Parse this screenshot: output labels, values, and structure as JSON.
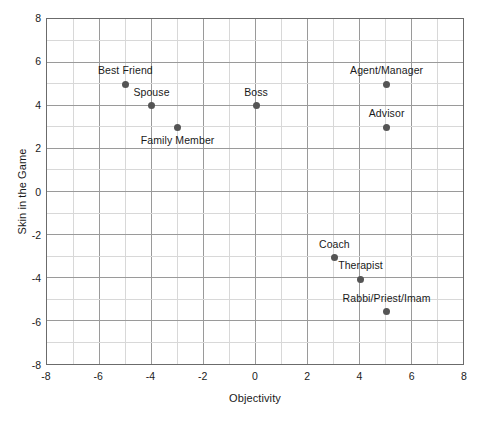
{
  "chart_data": {
    "type": "scatter",
    "title": "",
    "xlabel": "Objectivity",
    "ylabel": "Skin in the Game",
    "xlim": [
      -8,
      8
    ],
    "ylim": [
      -8,
      8
    ],
    "xticks": [
      "-8",
      "-6",
      "-4",
      "-2",
      "0",
      "2",
      "4",
      "6",
      "8"
    ],
    "xtick_values": [
      -8,
      -6,
      -4,
      -2,
      0,
      2,
      4,
      6,
      8
    ],
    "yticks": [
      "-8",
      "-6",
      "-4",
      "-2",
      "0",
      "2",
      "4",
      "6",
      "8"
    ],
    "ytick_values": [
      -8,
      -6,
      -4,
      -2,
      0,
      2,
      4,
      6,
      8
    ],
    "grid": true,
    "grid_minor_step": 1,
    "grid_major_step": 2,
    "legend": "none",
    "marker_color": "#555555",
    "grid_major_color": "#9a9a9a",
    "grid_minor_color": "#d8d8d8",
    "frame_color": "#6b6b6b",
    "points": [
      {
        "label": "Best Friend",
        "x": -5,
        "y": 5,
        "label_pos": "above"
      },
      {
        "label": "Spouse",
        "x": -4,
        "y": 4,
        "label_pos": "above"
      },
      {
        "label": "Family Member",
        "x": -3,
        "y": 3,
        "label_pos": "below"
      },
      {
        "label": "Boss",
        "x": 0,
        "y": 4,
        "label_pos": "above"
      },
      {
        "label": "Agent/Manager",
        "x": 5,
        "y": 5,
        "label_pos": "above"
      },
      {
        "label": "Advisor",
        "x": 5,
        "y": 3,
        "label_pos": "above"
      },
      {
        "label": "Coach",
        "x": 3,
        "y": -3,
        "label_pos": "above"
      },
      {
        "label": "Therapist",
        "x": 4,
        "y": -4,
        "label_pos": "above"
      },
      {
        "label": "Rabbi/Priest/Imam",
        "x": 5,
        "y": -5.5,
        "label_pos": "above"
      }
    ]
  }
}
